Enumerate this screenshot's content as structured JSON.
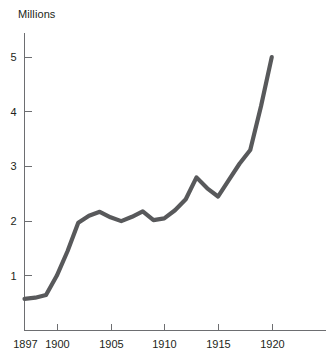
{
  "chart_data": {
    "type": "line",
    "title": "",
    "subtitle": "",
    "unit_label": "Millions",
    "xlabel": "",
    "ylabel": "Millions",
    "grid": false,
    "legend": "none",
    "line_color": "#58595b",
    "axis_color": "#6d6e71",
    "text_color": "#231f20",
    "background": "#ffffff",
    "xlim": [
      1897,
      1925
    ],
    "ylim": [
      0,
      5.45
    ],
    "xticks": [
      1897,
      1900,
      1905,
      1910,
      1915,
      1920
    ],
    "xtick_labels": [
      "1897",
      "1900",
      "1905",
      "1910",
      "1915",
      "1920"
    ],
    "yticks": [
      1,
      2,
      3,
      4,
      5
    ],
    "ytick_labels": [
      "1",
      "2",
      "3",
      "4",
      "5"
    ],
    "series": [
      {
        "name": "Millions",
        "x": [
          1897,
          1898,
          1899,
          1900,
          1901,
          1902,
          1903,
          1904,
          1905,
          1906,
          1907,
          1908,
          1909,
          1910,
          1911,
          1912,
          1913,
          1914,
          1915,
          1916,
          1917,
          1918,
          1919,
          1920
        ],
        "values": [
          0.58,
          0.6,
          0.65,
          1.0,
          1.45,
          1.97,
          2.1,
          2.17,
          2.07,
          2.0,
          2.08,
          2.18,
          2.02,
          2.05,
          2.2,
          2.4,
          2.8,
          2.6,
          2.45,
          2.75,
          3.05,
          3.3,
          4.1,
          5.0
        ]
      }
    ]
  }
}
